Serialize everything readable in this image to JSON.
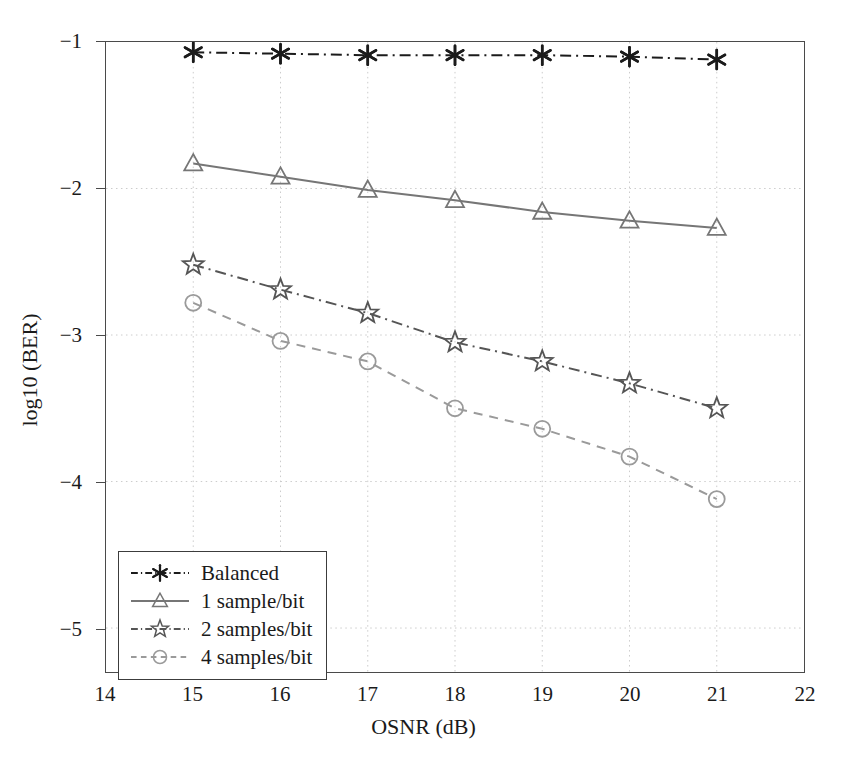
{
  "chart_data": {
    "type": "line",
    "title": "",
    "xlabel": "OSNR (dB)",
    "ylabel": "log10 (BER)",
    "xlim": [
      14,
      22
    ],
    "ylim": [
      -5.3,
      -1.0
    ],
    "xticks": [
      "14",
      "15",
      "16",
      "17",
      "18",
      "19",
      "20",
      "21",
      "22"
    ],
    "yticks": [
      "-1",
      "-2",
      "-3",
      "-4",
      "-5"
    ],
    "xtick_values": [
      14,
      15,
      16,
      17,
      18,
      19,
      20,
      21,
      22
    ],
    "ytick_values": [
      -1,
      -2,
      -3,
      -4,
      -5
    ],
    "grid": true,
    "grid_style": "dotted",
    "legend_position": "lower left",
    "x": [
      15,
      16,
      17,
      18,
      19,
      20,
      21
    ],
    "series": [
      {
        "name": "Balanced",
        "values": [
          -1.07,
          -1.08,
          -1.09,
          -1.09,
          -1.09,
          -1.1,
          -1.12
        ],
        "color": "#1b1b1b",
        "marker": "asterisk",
        "linestyle": "dash-dot"
      },
      {
        "name": "1 sample/bit",
        "values": [
          -1.83,
          -1.92,
          -2.01,
          -2.08,
          -2.16,
          -2.22,
          -2.27
        ],
        "color": "#767676",
        "marker": "triangle",
        "linestyle": "solid"
      },
      {
        "name": "2 samples/bit",
        "values": [
          -2.52,
          -2.69,
          -2.85,
          -3.05,
          -3.18,
          -3.33,
          -3.5
        ],
        "color": "#555555",
        "marker": "star",
        "linestyle": "dash-dot"
      },
      {
        "name": "4 samples/bit",
        "values": [
          -2.78,
          -3.04,
          -3.18,
          -3.5,
          -3.64,
          -3.83,
          -4.12
        ],
        "color": "#9a9a9a",
        "marker": "circle",
        "linestyle": "dashed"
      }
    ]
  },
  "legend": {
    "entries": [
      {
        "label": "Balanced"
      },
      {
        "label": "1 sample/bit"
      },
      {
        "label": "2 samples/bit"
      },
      {
        "label": "4 samples/bit"
      }
    ]
  },
  "colors": {
    "axis": "#4a4a4a",
    "grid": "#cccccc",
    "text": "#1a1a1a",
    "background": "#ffffff"
  }
}
